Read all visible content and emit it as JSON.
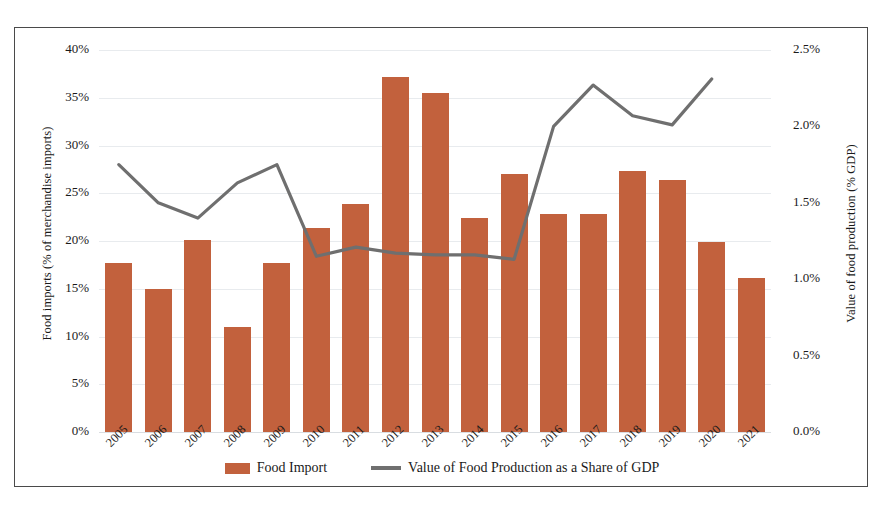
{
  "chart_data": {
    "type": "bar",
    "title": "",
    "subtitle": "",
    "xlabel": "",
    "ylabel": "Food imports (% of merchandise imports)",
    "y2label": "Value of food production (% GDP)",
    "grid": true,
    "legend_position": "bottom-center",
    "categories": [
      "2005",
      "2006",
      "2007",
      "2008",
      "2009",
      "2010",
      "2011",
      "2012",
      "2013",
      "2014",
      "2015",
      "2016",
      "2017",
      "2018",
      "2019",
      "2020",
      "2021"
    ],
    "ylim": [
      0,
      40
    ],
    "y_ticks": [
      0,
      5,
      10,
      15,
      20,
      25,
      30,
      35,
      40
    ],
    "y_tick_labels": [
      "0%",
      "5%",
      "10%",
      "15%",
      "20%",
      "25%",
      "30%",
      "35%",
      "40%"
    ],
    "y2lim": [
      0,
      2.5
    ],
    "y2_ticks": [
      0,
      0.5,
      1.0,
      1.5,
      2.0,
      2.5
    ],
    "y2_tick_labels": [
      "0.0%",
      "0.5%",
      "1.0%",
      "1.5%",
      "2.0%",
      "2.5%"
    ],
    "series": [
      {
        "name": "Food Import",
        "type": "bar",
        "axis": "left",
        "color": "#c2613d",
        "unit": "%",
        "values": [
          17.7,
          15.0,
          20.1,
          11.0,
          17.7,
          21.4,
          23.9,
          37.2,
          35.5,
          22.4,
          27.0,
          22.8,
          22.8,
          27.3,
          26.4,
          19.9,
          16.1
        ]
      },
      {
        "name": "Value of Food Production as a Share of GDP",
        "type": "line",
        "axis": "right",
        "color": "#6f6f6f",
        "unit": "%",
        "values": [
          1.75,
          1.5,
          1.4,
          1.63,
          1.75,
          1.15,
          1.21,
          1.17,
          1.16,
          1.16,
          1.13,
          2.0,
          2.27,
          2.07,
          2.01,
          2.31,
          null
        ]
      }
    ]
  },
  "axes": {
    "left_title": "Food imports (% of merchandise imports)",
    "right_title": "Value of food production (% GDP)"
  },
  "legend": {
    "items": [
      {
        "label": "Food Import",
        "marker": "bar-swatch",
        "color": "#c2613d"
      },
      {
        "label": "Value of Food Production as a Share of GDP",
        "marker": "line-swatch",
        "color": "#6f6f6f"
      }
    ]
  }
}
